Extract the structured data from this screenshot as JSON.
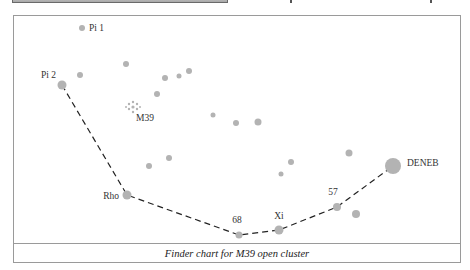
{
  "caption": "Finder chart for M39 open cluster",
  "colors": {
    "star": "#b3b3b3",
    "path": "#222222",
    "frame": "#9a9a9a",
    "label": "#333333"
  },
  "chart_data": {
    "type": "scatter",
    "title": "Finder chart for M39 open cluster",
    "xlabel": "",
    "ylabel": "",
    "grid": false,
    "named_stars": [
      {
        "name": "Pi 1",
        "x": 82,
        "y": 28,
        "r": 3
      },
      {
        "name": "Pi 2",
        "x": 62,
        "y": 85,
        "r": 4.5
      },
      {
        "name": "Rho",
        "x": 127,
        "y": 195,
        "r": 4.5
      },
      {
        "name": "68",
        "x": 239,
        "y": 235,
        "r": 3.5
      },
      {
        "name": "Xi",
        "x": 279,
        "y": 230,
        "r": 4.5
      },
      {
        "name": "57",
        "x": 337,
        "y": 207,
        "r": 4
      },
      {
        "name": "DENEB",
        "x": 393,
        "y": 166,
        "r": 8
      }
    ],
    "other_stars": [
      {
        "x": 80,
        "y": 75,
        "r": 3
      },
      {
        "x": 126,
        "y": 64,
        "r": 3
      },
      {
        "x": 165,
        "y": 78,
        "r": 3
      },
      {
        "x": 179,
        "y": 76,
        "r": 2.5
      },
      {
        "x": 189,
        "y": 71,
        "r": 3
      },
      {
        "x": 157,
        "y": 94,
        "r": 3
      },
      {
        "x": 213,
        "y": 115,
        "r": 2.5
      },
      {
        "x": 236,
        "y": 123,
        "r": 3
      },
      {
        "x": 258,
        "y": 122,
        "r": 3.5
      },
      {
        "x": 149,
        "y": 166,
        "r": 3
      },
      {
        "x": 169,
        "y": 158,
        "r": 3
      },
      {
        "x": 281,
        "y": 174,
        "r": 2.5
      },
      {
        "x": 291,
        "y": 162,
        "r": 3
      },
      {
        "x": 349,
        "y": 153,
        "r": 3.5
      },
      {
        "x": 356,
        "y": 214,
        "r": 4
      }
    ],
    "cluster": {
      "name": "M39",
      "x": 133,
      "y": 107
    },
    "star_hop_path": [
      "Pi 2",
      "Rho",
      "68",
      "Xi",
      "57",
      "DENEB"
    ]
  }
}
